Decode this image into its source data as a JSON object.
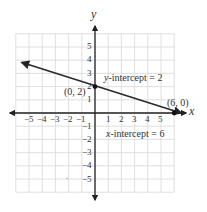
{
  "chart_data": {
    "type": "line",
    "title": "",
    "xlabel": "x",
    "ylabel": "y",
    "xlim": [
      -6,
      6
    ],
    "ylim": [
      -6,
      6
    ],
    "grid": true,
    "x_ticks": [
      "−5",
      "−4",
      "−3",
      "−2",
      "−1",
      "1",
      "2",
      "3",
      "4",
      "5"
    ],
    "y_ticks": [
      "5",
      "4",
      "3",
      "2",
      "1",
      "−1",
      "−2",
      "−3",
      "−4",
      "−5"
    ],
    "series": [
      {
        "name": "line",
        "equation": "y = -x/3 + 2",
        "x": [
          -5.5,
          0,
          6
        ],
        "y": [
          3.83,
          2,
          0
        ]
      }
    ],
    "points": [
      {
        "label": "(0, 2)",
        "x": 0,
        "y": 2
      },
      {
        "label": "(6, 0)",
        "x": 6,
        "y": 0
      }
    ],
    "annotations": [
      {
        "text_var": "y",
        "text_rest": "-intercept = 2"
      },
      {
        "text_var": "x",
        "text_rest": "-intercept = 6"
      }
    ]
  },
  "labels": {
    "x_axis": "x",
    "y_axis": "y",
    "point_y_int": "(0, 2)",
    "point_x_int": "(6, 0)",
    "y_int_var": "y",
    "y_int_rest": "-intercept = 2",
    "x_int_var": "x",
    "x_int_rest": "-intercept = 6",
    "xt": [
      "−5",
      "−4",
      "−3",
      "−2",
      "−1",
      "1",
      "2",
      "3",
      "4",
      "5"
    ],
    "yt": [
      "5",
      "4",
      "3",
      "2",
      "1",
      "−1",
      "−2",
      "−3",
      "−4",
      "−5"
    ]
  },
  "colors": {
    "grid": "#d8d8d8",
    "axis": "#222222",
    "line": "#2b2b2b"
  }
}
